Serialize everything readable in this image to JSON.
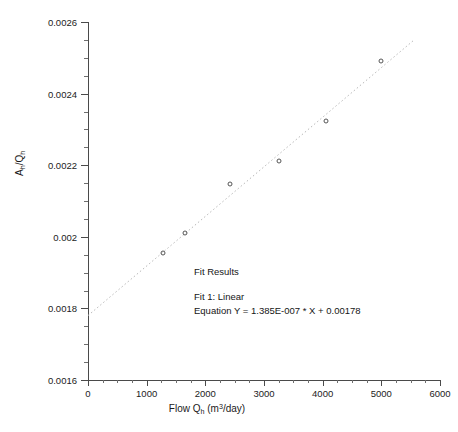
{
  "chart_data": {
    "type": "scatter",
    "title": "",
    "xlabel": "Flow Qh (m3/day)",
    "ylabel": "Ah/Qh",
    "xlabel_parts": {
      "pre": "Flow Q",
      "sub": "h",
      "mid": " (m",
      "sup": "3",
      "post": "/day)"
    },
    "ylabel_parts": {
      "pre": "A",
      "sub1": "h",
      "mid": "/Q",
      "sub2": "h"
    },
    "xlim": [
      0,
      6000
    ],
    "ylim": [
      0.0016,
      0.0026
    ],
    "xticks": [
      0,
      1000,
      2000,
      3000,
      4000,
      5000,
      6000
    ],
    "xtick_labels": [
      "0",
      "1000",
      "2000",
      "3000",
      "4000",
      "5000",
      "6000"
    ],
    "yticks": [
      0.0016,
      0.0018,
      0.002,
      0.0022,
      0.0024,
      0.0026
    ],
    "ytick_labels": [
      "0.0016",
      "0.0018",
      "0.002",
      "0.0022",
      "0.0024",
      "0.0026"
    ],
    "x_minor_interval": 250,
    "y_minor_interval": 5e-05,
    "grid": false,
    "legend": "none",
    "marker_style": "open-circle",
    "marker_color": "#555555",
    "fit_line_style": "dotted",
    "fit_line_color": "#b9b9b9",
    "points": [
      {
        "x": 1270,
        "y": 0.001955
      },
      {
        "x": 1660,
        "y": 0.002012
      },
      {
        "x": 2420,
        "y": 0.002148
      },
      {
        "x": 3250,
        "y": 0.002212
      },
      {
        "x": 4060,
        "y": 0.002323
      },
      {
        "x": 5000,
        "y": 0.002492
      }
    ],
    "fit": {
      "slope": 1.385e-07,
      "intercept": 0.00178,
      "x_start": 0,
      "x_end": 5550
    },
    "annotation": {
      "heading": "Fit Results",
      "line1": "Fit 1: Linear",
      "line2": "Equation Y = 1.385E-007 * X + 0.00178"
    }
  },
  "colors": {
    "axis": "#4a4a4a",
    "text": "#1a1a1a",
    "marker": "#555555",
    "fit_line": "#b9b9b9",
    "background": "#ffffff"
  }
}
